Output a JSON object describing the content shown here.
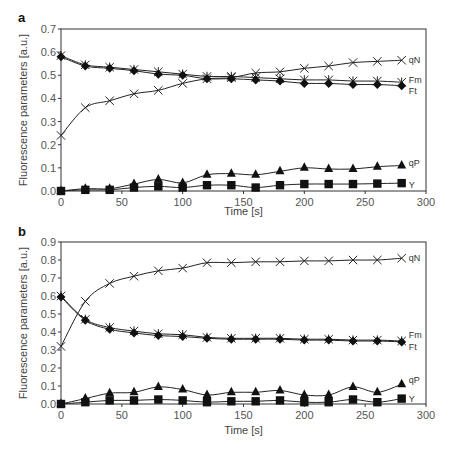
{
  "chart_data": [
    {
      "panel": "a",
      "type": "line",
      "title": "",
      "xlabel": "Time [s]",
      "ylabel": "Fluorescence parameters [a.u.]",
      "xlim": [
        0,
        300
      ],
      "ylim": [
        0,
        0.7
      ],
      "xticks": [
        0,
        50,
        100,
        150,
        200,
        250,
        300
      ],
      "yticks": [
        "0.0",
        "0.1",
        "0.2",
        "0.3",
        "0.4",
        "0.5",
        "0.6",
        "0.7"
      ],
      "grid": false,
      "legend": "inline labels at right end of each series",
      "x": [
        0,
        20,
        40,
        60,
        80,
        100,
        120,
        140,
        160,
        180,
        200,
        220,
        240,
        260,
        280
      ],
      "series": [
        {
          "name": "qN",
          "marker": "x",
          "values": [
            0.24,
            0.36,
            0.39,
            0.42,
            0.435,
            0.465,
            0.485,
            0.49,
            0.51,
            0.515,
            0.53,
            0.54,
            0.555,
            0.56,
            0.565
          ]
        },
        {
          "name": "Fm",
          "marker": "star",
          "values": [
            0.585,
            0.545,
            0.535,
            0.525,
            0.515,
            0.505,
            0.495,
            0.495,
            0.49,
            0.485,
            0.48,
            0.48,
            0.475,
            0.475,
            0.47
          ]
        },
        {
          "name": "Ft",
          "marker": "diamond",
          "values": [
            0.58,
            0.54,
            0.53,
            0.52,
            0.505,
            0.5,
            0.485,
            0.485,
            0.48,
            0.475,
            0.465,
            0.465,
            0.46,
            0.46,
            0.455
          ]
        },
        {
          "name": "qP",
          "marker": "triangle",
          "values": [
            0.0,
            0.01,
            0.01,
            0.03,
            0.05,
            0.035,
            0.07,
            0.075,
            0.07,
            0.085,
            0.1,
            0.095,
            0.095,
            0.105,
            0.11
          ]
        },
        {
          "name": "Y",
          "marker": "square",
          "values": [
            0.0,
            0.005,
            0.005,
            0.015,
            0.02,
            0.015,
            0.025,
            0.025,
            0.015,
            0.025,
            0.03,
            0.03,
            0.03,
            0.032,
            0.034
          ]
        }
      ]
    },
    {
      "panel": "b",
      "type": "line",
      "title": "",
      "xlabel": "Time [s]",
      "ylabel": "Fluorescence parameters [a.u.]",
      "xlim": [
        0,
        300
      ],
      "ylim": [
        0,
        0.9
      ],
      "xticks": [
        0,
        50,
        100,
        150,
        200,
        250,
        300
      ],
      "yticks": [
        "0.0",
        "0.1",
        "0.2",
        "0.3",
        "0.4",
        "0.5",
        "0.6",
        "0.7",
        "0.8",
        "0.9"
      ],
      "grid": false,
      "legend": "inline labels at right end of each series",
      "x": [
        0,
        20,
        40,
        60,
        80,
        100,
        120,
        140,
        160,
        180,
        200,
        220,
        240,
        260,
        280
      ],
      "series": [
        {
          "name": "qN",
          "marker": "x",
          "values": [
            0.32,
            0.57,
            0.67,
            0.71,
            0.74,
            0.755,
            0.785,
            0.785,
            0.79,
            0.79,
            0.795,
            0.795,
            0.8,
            0.8,
            0.81
          ]
        },
        {
          "name": "Fm",
          "marker": "star",
          "values": [
            0.6,
            0.47,
            0.425,
            0.405,
            0.39,
            0.385,
            0.37,
            0.365,
            0.365,
            0.365,
            0.36,
            0.36,
            0.355,
            0.355,
            0.35
          ]
        },
        {
          "name": "Ft",
          "marker": "diamond",
          "values": [
            0.595,
            0.465,
            0.415,
            0.395,
            0.38,
            0.375,
            0.365,
            0.36,
            0.36,
            0.36,
            0.355,
            0.355,
            0.35,
            0.35,
            0.345
          ]
        },
        {
          "name": "qP",
          "marker": "triangle",
          "values": [
            0.0,
            0.03,
            0.06,
            0.065,
            0.095,
            0.08,
            0.05,
            0.065,
            0.065,
            0.075,
            0.05,
            0.05,
            0.095,
            0.065,
            0.11
          ]
        },
        {
          "name": "Y",
          "marker": "square",
          "values": [
            0.0,
            0.01,
            0.02,
            0.02,
            0.025,
            0.02,
            0.01,
            0.015,
            0.015,
            0.02,
            0.01,
            0.01,
            0.025,
            0.01,
            0.03
          ]
        }
      ]
    }
  ],
  "layout": {
    "panels": [
      {
        "x0": 61,
        "x1": 426,
        "y0": 191,
        "y1": 29,
        "label_x": 18,
        "label_y": 22,
        "xlabel_y": 215,
        "series_label_dy": {
          "qN": 0,
          "Fm": -2,
          "Ft": 5,
          "qP": -3,
          "Y": 2
        }
      },
      {
        "x0": 61,
        "x1": 426,
        "y0": 404,
        "y1": 242,
        "label_x": 18,
        "label_y": 236,
        "xlabel_y": 434,
        "series_label_dy": {
          "qN": 0,
          "Fm": -6,
          "Ft": 5,
          "qP": -4,
          "Y": 0
        }
      }
    ],
    "line_color": "#222222",
    "axis_color": "#333333"
  }
}
